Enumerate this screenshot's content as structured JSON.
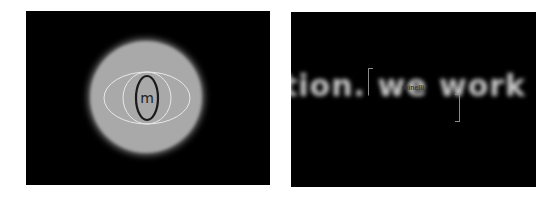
{
  "left_panel": {
    "logo_letter": "m",
    "colors": {
      "background": "#000000",
      "disc": "#a9a9a9",
      "orbit_lines": "#e8e8e8",
      "logo_ring": "#1a1a1a"
    }
  },
  "right_panel": {
    "blurred_text": "tion. we work",
    "brand_label": "minelli",
    "colors": {
      "background": "#000000",
      "text": "#c9c9c9",
      "bracket": "#8a8a8a"
    }
  }
}
